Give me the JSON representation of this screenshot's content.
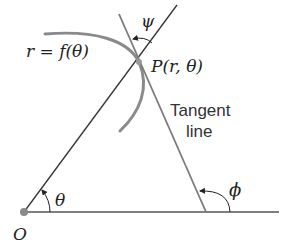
{
  "diagram": {
    "labels": {
      "curve": "r = f(θ)",
      "point": "P(r, θ)",
      "tangent_line_1": "Tangent",
      "tangent_line_2": "line",
      "psi": "ψ",
      "theta": "θ",
      "phi": "ϕ",
      "origin": "O"
    },
    "colors": {
      "curve": "#8a8a8a",
      "tangent": "#7a7a7a",
      "radial": "#333333",
      "axis": "#555555",
      "origin_dot": "#8a8a8a"
    }
  }
}
